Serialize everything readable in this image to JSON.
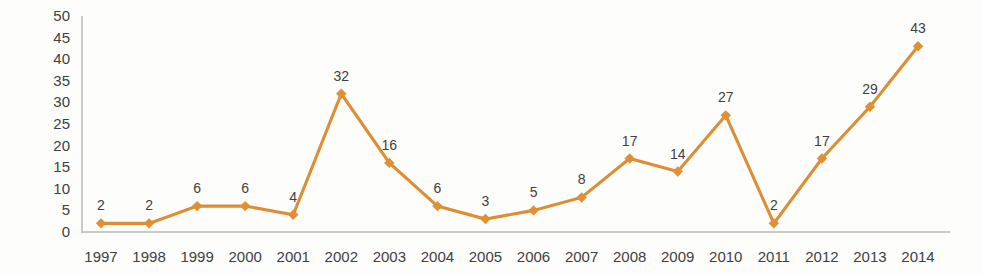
{
  "chart_data": {
    "type": "line",
    "title": "",
    "subtitle": "",
    "xlabel": "",
    "ylabel": "",
    "categories": [
      "1997",
      "1998",
      "1999",
      "2000",
      "2001",
      "2002",
      "2003",
      "2004",
      "2005",
      "2006",
      "2007",
      "2008",
      "2009",
      "2010",
      "2011",
      "2012",
      "2013",
      "2014"
    ],
    "values": [
      2,
      2,
      6,
      6,
      4,
      32,
      16,
      6,
      3,
      5,
      8,
      17,
      14,
      27,
      2,
      17,
      29,
      43
    ],
    "data_labels": [
      "2",
      "2",
      "6",
      "6",
      "4",
      "32",
      "16",
      "6",
      "3",
      "5",
      "8",
      "17",
      "14",
      "27",
      "2",
      "17",
      "29",
      "43"
    ],
    "ylim": [
      0,
      50
    ],
    "yticks": [
      0,
      5,
      10,
      15,
      20,
      25,
      30,
      35,
      40,
      45,
      50
    ],
    "ytick_labels": [
      "0",
      "5",
      "10",
      "15",
      "20",
      "25",
      "30",
      "35",
      "40",
      "45",
      "50"
    ],
    "grid": false,
    "legend": false,
    "legend_position": "none",
    "marker": "diamond",
    "series": [
      {
        "name": "",
        "values": [
          2,
          2,
          6,
          6,
          4,
          32,
          16,
          6,
          3,
          5,
          8,
          17,
          14,
          27,
          2,
          17,
          29,
          43
        ]
      }
    ],
    "colors": {
      "line": "#DE8E32",
      "marker": "#E08F33",
      "axis": "#c9c9c9",
      "label_text": "#3f3f41",
      "background": "#fdfdfc"
    }
  }
}
